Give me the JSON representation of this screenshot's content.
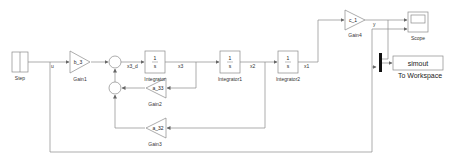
{
  "diagram": {
    "type": "simulink-block-diagram",
    "blocks": {
      "step": {
        "name": "Step"
      },
      "gain1": {
        "name": "Gain1",
        "value": "b_3"
      },
      "sum1": {
        "name": "Sum"
      },
      "integrator": {
        "name": "Integrator",
        "num": "1",
        "den": "s"
      },
      "integrator1": {
        "name": "Integrator1",
        "num": "1",
        "den": "s"
      },
      "integrator2": {
        "name": "Integrator2",
        "num": "1",
        "den": "s"
      },
      "gain4": {
        "name": "Gain4",
        "value": "c_1"
      },
      "scope": {
        "name": "Scope"
      },
      "mux": {
        "name": "Mux"
      },
      "to_workspace": {
        "name": "To Workspace",
        "value": "simout"
      },
      "sum2": {
        "name": "Sum1"
      },
      "gain2": {
        "name": "Gain2",
        "value": "a_33"
      },
      "gain3": {
        "name": "Gain3",
        "value": "a_32"
      }
    },
    "signals": {
      "u": "u",
      "x3_d": "x3_d",
      "x3": "x3",
      "x2": "x2",
      "x1": "x1",
      "y": "y"
    },
    "colors": {
      "line": "#8a8a8a",
      "block_border": "#8a8a8a",
      "background": "#ffffff"
    }
  }
}
